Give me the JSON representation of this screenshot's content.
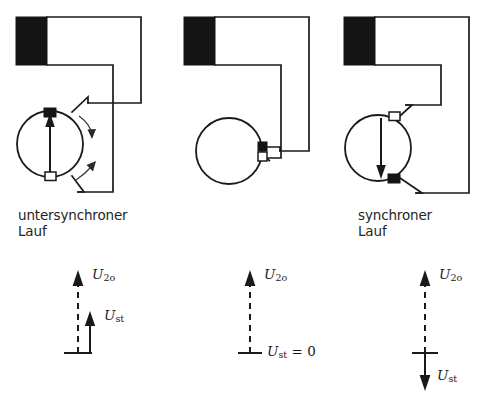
{
  "figure": {
    "ink_color": "#1a1a1a",
    "background_color": "#ffffff"
  },
  "panels": [
    {
      "id": "untersynchron",
      "caption": "untersynchroner\nLauf",
      "top_contact": "filled",
      "bottom_contact": "open",
      "rotor_arrow": "up",
      "rotation_arrows": "two-curved-right",
      "source_block": "filled-rectangle"
    },
    {
      "id": "synchron",
      "caption": "synchroner\nLauf",
      "top_contact": "filled",
      "bottom_contact": "open",
      "rotor_arrow": "none",
      "rotation_arrows": "none",
      "source_block": "filled-rectangle"
    },
    {
      "id": "uebersynchron",
      "caption": "übersynchroner\nLauf",
      "top_contact": "open",
      "bottom_contact": "filled",
      "rotor_arrow": "down",
      "rotation_arrows": "none",
      "source_block": "filled-rectangle"
    }
  ],
  "phasors": [
    {
      "id": "phasor-untersynchron",
      "u20_label": "U",
      "u20_sub": "2o",
      "u20_direction": "up",
      "u20_style": "dashed",
      "ust_label": "U",
      "ust_sub": "st",
      "ust_suffix": "",
      "ust_direction": "up",
      "ust_style": "solid",
      "ust_shown": true,
      "baseline": true
    },
    {
      "id": "phasor-synchron",
      "u20_label": "U",
      "u20_sub": "2o",
      "u20_direction": "up",
      "u20_style": "dashed",
      "ust_label": "U",
      "ust_sub": "st",
      "ust_suffix": " = 0",
      "ust_direction": "none",
      "ust_style": "none",
      "ust_shown": false,
      "baseline": true
    },
    {
      "id": "phasor-uebersynchron",
      "u20_label": "U",
      "u20_sub": "2o",
      "u20_direction": "up",
      "u20_style": "dashed",
      "ust_label": "U",
      "ust_sub": "st",
      "ust_suffix": "",
      "ust_direction": "down",
      "ust_style": "solid",
      "ust_shown": true,
      "baseline": true
    }
  ]
}
